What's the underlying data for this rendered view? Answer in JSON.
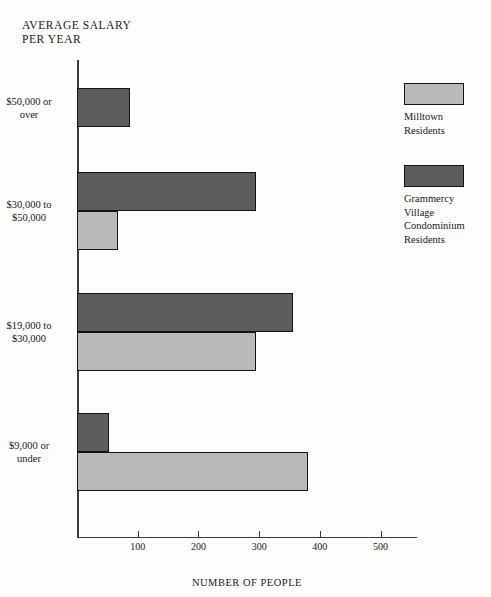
{
  "chart_data": {
    "type": "bar",
    "orientation": "horizontal",
    "title": "AVERAGE SALARY\nPER YEAR",
    "xlabel": "NUMBER OF PEOPLE",
    "ylabel": "AVERAGE SALARY PER YEAR",
    "xlim": [
      0,
      560
    ],
    "xticks": [
      100,
      200,
      300,
      400,
      500
    ],
    "xtick_labels": [
      "100",
      "200",
      "300",
      "400",
      "500"
    ],
    "grid": false,
    "legend_position": "right",
    "categories": [
      "$50,000 or\nover",
      "$30,000 to\n$50,000",
      "$19,000 to\n$30,000",
      "$9,000 or\nunder"
    ],
    "series": [
      {
        "name": "Grammercy\nVillage\nCondominium\nResidents",
        "color": "#5c5c5c",
        "values": [
          88,
          295,
          355,
          52
        ]
      },
      {
        "name": "Milltown\nResidents",
        "color": "#b9b9b9",
        "values": [
          0,
          68,
          295,
          380
        ]
      }
    ]
  },
  "legend": {
    "items": [
      {
        "label": "Milltown\nResidents",
        "swatch": "light"
      },
      {
        "label": "Grammercy\nVillage\nCondominium\nResidents",
        "swatch": "dark"
      }
    ]
  }
}
